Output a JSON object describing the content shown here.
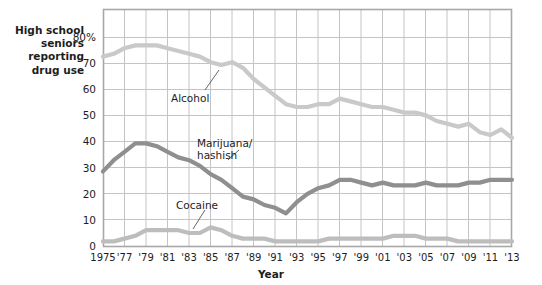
{
  "axes": {
    "y_caption": "High school\nseniors\nreporting\ndrug use",
    "y_caption_lines": [
      "High school",
      "seniors",
      "reporting",
      "drug use"
    ],
    "y_ticks": [
      "80%",
      "70",
      "60",
      "50",
      "40",
      "30",
      "20",
      "10",
      "0"
    ],
    "x_title": "Year",
    "x_ticks": [
      "1975",
      "'77",
      "'79",
      "'81",
      "'83",
      "'85",
      "'87",
      "'89",
      "'91",
      "'93",
      "'95",
      "'97",
      "'99",
      "'01",
      "'03",
      "'05",
      "'07",
      "'09",
      "'11",
      "'13"
    ]
  },
  "labels": {
    "alcohol": "Alcohol",
    "marijuana_line1": "Marijuana/",
    "marijuana_line2": "hashish",
    "cocaine": "Cocaine"
  },
  "colors": {
    "alcohol": "#c9c9c9",
    "marijuana": "#8f8f8f",
    "cocaine": "#bdbdbd",
    "grid": "#c4c4c4",
    "frame": "#a8a8a8",
    "text": "#1d1d1d",
    "background": "#ffffff"
  },
  "chart_data": {
    "type": "line",
    "title": "",
    "xlabel": "Year",
    "ylabel": "High school seniors reporting drug use",
    "xlim": [
      1975,
      2013
    ],
    "ylim": [
      0,
      85
    ],
    "yticks": [
      0,
      10,
      20,
      30,
      40,
      50,
      60,
      70,
      80
    ],
    "ytick_labels": [
      "0",
      "10",
      "20",
      "30",
      "40",
      "50",
      "60",
      "70",
      "80%"
    ],
    "xticks": [
      1975,
      1977,
      1979,
      1981,
      1983,
      1985,
      1987,
      1989,
      1991,
      1993,
      1995,
      1997,
      1999,
      2001,
      2003,
      2005,
      2007,
      2009,
      2011,
      2013
    ],
    "xtick_labels": [
      "1975",
      "'77",
      "'79",
      "'81",
      "'83",
      "'85",
      "'87",
      "'89",
      "'91",
      "'93",
      "'95",
      "'97",
      "'99",
      "'01",
      "'03",
      "'05",
      "'07",
      "'09",
      "'11",
      "'13"
    ],
    "grid": true,
    "legend": "inline annotations",
    "units": "percent of high school seniors reporting use in past year",
    "x": [
      1975,
      1976,
      1977,
      1978,
      1979,
      1980,
      1981,
      1982,
      1983,
      1984,
      1985,
      1986,
      1987,
      1988,
      1989,
      1990,
      1991,
      1992,
      1993,
      1994,
      1995,
      1996,
      1997,
      1998,
      1999,
      2000,
      2001,
      2002,
      2003,
      2004,
      2005,
      2006,
      2007,
      2008,
      2009,
      2010,
      2011,
      2012,
      2013
    ],
    "series": [
      {
        "name": "Alcohol",
        "color": "#c9c9c9",
        "values": [
          68,
          69,
          71,
          72,
          72,
          72,
          71,
          70,
          69,
          68,
          66,
          65,
          66,
          64,
          60,
          57,
          54,
          51,
          50,
          50,
          51,
          51,
          53,
          52,
          51,
          50,
          50,
          49,
          48,
          48,
          47,
          45,
          44,
          43,
          44,
          41,
          40,
          42,
          39
        ]
      },
      {
        "name": "Marijuana/hashish",
        "color": "#8f8f8f",
        "values": [
          27,
          31,
          34,
          37,
          37,
          36,
          34,
          32,
          31,
          29,
          26,
          24,
          21,
          18,
          17,
          15,
          14,
          12,
          16,
          19,
          21,
          22,
          24,
          24,
          23,
          22,
          23,
          22,
          22,
          22,
          23,
          22,
          22,
          22,
          23,
          23,
          24,
          24,
          24
        ]
      },
      {
        "name": "Cocaine",
        "color": "#bdbdbd",
        "values": [
          2,
          2,
          3,
          4,
          6,
          6,
          6,
          6,
          5,
          5,
          7,
          6,
          4,
          3,
          3,
          3,
          2,
          2,
          2,
          2,
          2,
          3,
          3,
          3,
          3,
          3,
          3,
          4,
          4,
          4,
          3,
          3,
          3,
          2,
          2,
          2,
          2,
          2,
          2
        ]
      }
    ]
  },
  "geometry": {
    "plot_left": 103,
    "plot_right": 512,
    "plot_top": 9,
    "plot_bottom": 247
  }
}
